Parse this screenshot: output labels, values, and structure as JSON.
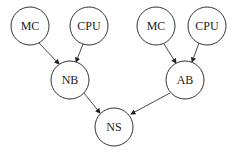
{
  "diagram": {
    "type": "directed-graph",
    "nodes": [
      {
        "id": "mc1",
        "label": "MC",
        "x": 30,
        "y": 26
      },
      {
        "id": "cpu1",
        "label": "CPU",
        "x": 89,
        "y": 26
      },
      {
        "id": "nb",
        "label": "NB",
        "x": 70,
        "y": 80
      },
      {
        "id": "mc2",
        "label": "MC",
        "x": 156,
        "y": 26
      },
      {
        "id": "cpu2",
        "label": "CPU",
        "x": 207,
        "y": 26
      },
      {
        "id": "ab",
        "label": "AB",
        "x": 185,
        "y": 80
      },
      {
        "id": "ns",
        "label": "NS",
        "x": 114,
        "y": 127
      }
    ],
    "edges": [
      {
        "from": "mc1",
        "to": "nb"
      },
      {
        "from": "cpu1",
        "to": "nb"
      },
      {
        "from": "mc2",
        "to": "ab"
      },
      {
        "from": "cpu2",
        "to": "ab"
      },
      {
        "from": "nb",
        "to": "ns"
      },
      {
        "from": "ab",
        "to": "ns"
      }
    ]
  }
}
